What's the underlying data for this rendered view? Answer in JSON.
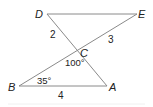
{
  "diagram": {
    "type": "geometry",
    "points": {
      "D": {
        "label": "D",
        "x": 47,
        "y": 14
      },
      "E": {
        "label": "E",
        "x": 137,
        "y": 14
      },
      "C": {
        "label": "C",
        "x": 78,
        "y": 50
      },
      "B": {
        "label": "B",
        "x": 19,
        "y": 86
      },
      "A": {
        "label": "A",
        "x": 107,
        "y": 86
      }
    },
    "segments": [
      [
        "D",
        "E"
      ],
      [
        "D",
        "A"
      ],
      [
        "B",
        "E"
      ],
      [
        "B",
        "A"
      ]
    ],
    "lengths": {
      "DC": "2",
      "CE": "3",
      "BA": "4"
    },
    "angles": {
      "BCA": "100°",
      "CBA": "35°"
    }
  }
}
